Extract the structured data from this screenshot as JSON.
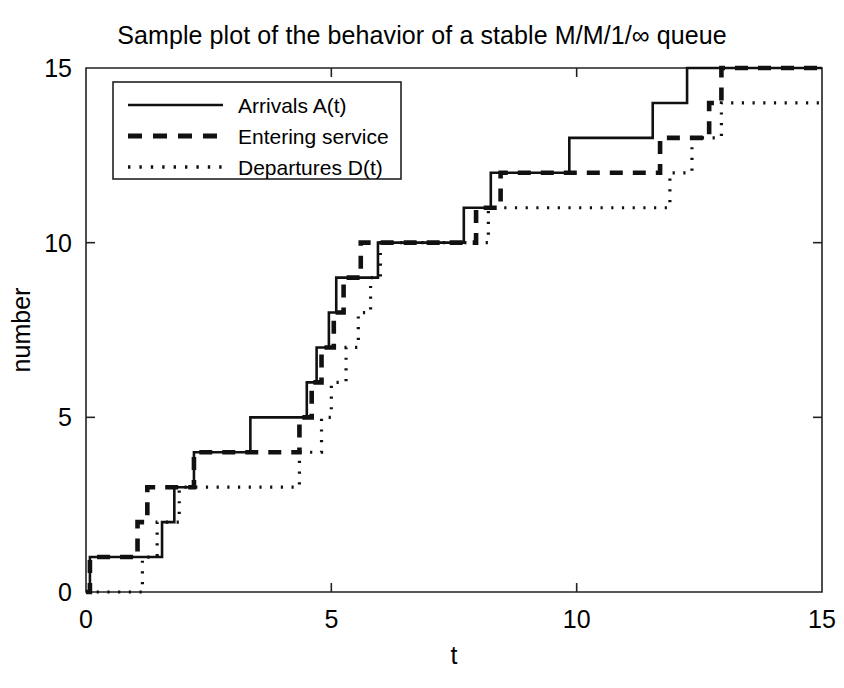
{
  "chart_data": {
    "type": "line",
    "title": "Sample plot of the behavior of a stable M/M/1/∞ queue",
    "xlabel": "t",
    "ylabel": "number",
    "xlim": [
      0,
      15
    ],
    "ylim": [
      0,
      15
    ],
    "xticks": [
      0,
      5,
      10,
      15
    ],
    "yticks": [
      0,
      5,
      10,
      15
    ],
    "xtick_labels": [
      "0",
      "5",
      "10",
      "15"
    ],
    "ytick_labels": [
      "0",
      "5",
      "10",
      "15"
    ],
    "grid": false,
    "legend_position": "upper-left",
    "step_type": "post",
    "series": [
      {
        "name": "Arrivals A(t)",
        "style": "solid",
        "points": [
          [
            0.0,
            0
          ],
          [
            0.08,
            0
          ],
          [
            0.08,
            1
          ],
          [
            1.55,
            1
          ],
          [
            1.55,
            2
          ],
          [
            1.8,
            2
          ],
          [
            1.8,
            3
          ],
          [
            2.2,
            3
          ],
          [
            2.2,
            4
          ],
          [
            3.35,
            4
          ],
          [
            3.35,
            5
          ],
          [
            4.5,
            5
          ],
          [
            4.5,
            6
          ],
          [
            4.7,
            6
          ],
          [
            4.7,
            7
          ],
          [
            4.95,
            7
          ],
          [
            4.95,
            8
          ],
          [
            5.1,
            8
          ],
          [
            5.1,
            9
          ],
          [
            5.95,
            9
          ],
          [
            5.95,
            10
          ],
          [
            7.7,
            10
          ],
          [
            7.7,
            11
          ],
          [
            8.25,
            11
          ],
          [
            8.25,
            12
          ],
          [
            9.85,
            12
          ],
          [
            9.85,
            13
          ],
          [
            11.55,
            13
          ],
          [
            11.55,
            14
          ],
          [
            12.25,
            14
          ],
          [
            12.25,
            15
          ],
          [
            15.0,
            15
          ]
        ]
      },
      {
        "name": "Entering service",
        "style": "dashed",
        "points": [
          [
            0.0,
            0
          ],
          [
            0.08,
            0
          ],
          [
            0.08,
            1
          ],
          [
            1.05,
            1
          ],
          [
            1.05,
            2
          ],
          [
            1.25,
            2
          ],
          [
            1.25,
            3
          ],
          [
            2.2,
            3
          ],
          [
            2.2,
            4
          ],
          [
            4.35,
            4
          ],
          [
            4.35,
            5
          ],
          [
            4.6,
            5
          ],
          [
            4.6,
            6
          ],
          [
            4.8,
            6
          ],
          [
            4.8,
            7
          ],
          [
            5.05,
            7
          ],
          [
            5.05,
            8
          ],
          [
            5.25,
            8
          ],
          [
            5.25,
            9
          ],
          [
            5.6,
            9
          ],
          [
            5.6,
            10
          ],
          [
            7.95,
            10
          ],
          [
            7.95,
            11
          ],
          [
            8.45,
            11
          ],
          [
            8.45,
            12
          ],
          [
            11.7,
            12
          ],
          [
            11.7,
            13
          ],
          [
            12.7,
            13
          ],
          [
            12.7,
            14
          ],
          [
            12.95,
            14
          ],
          [
            12.95,
            15
          ],
          [
            15.0,
            15
          ]
        ]
      },
      {
        "name": "Departures D(t)",
        "style": "dotted",
        "points": [
          [
            0.0,
            0
          ],
          [
            1.15,
            0
          ],
          [
            1.15,
            1
          ],
          [
            1.45,
            1
          ],
          [
            1.45,
            2
          ],
          [
            1.9,
            2
          ],
          [
            1.9,
            3
          ],
          [
            4.35,
            3
          ],
          [
            4.35,
            4
          ],
          [
            4.8,
            4
          ],
          [
            4.8,
            5
          ],
          [
            5.0,
            5
          ],
          [
            5.0,
            6
          ],
          [
            5.3,
            6
          ],
          [
            5.3,
            7
          ],
          [
            5.55,
            7
          ],
          [
            5.55,
            8
          ],
          [
            5.8,
            8
          ],
          [
            5.8,
            9
          ],
          [
            6.0,
            9
          ],
          [
            6.0,
            10
          ],
          [
            8.2,
            10
          ],
          [
            8.2,
            11
          ],
          [
            11.9,
            11
          ],
          [
            11.9,
            12
          ],
          [
            12.35,
            12
          ],
          [
            12.35,
            13
          ],
          [
            12.95,
            13
          ],
          [
            12.95,
            14
          ],
          [
            13.95,
            14
          ],
          [
            15.0,
            14
          ]
        ]
      }
    ]
  },
  "legend": {
    "entries": [
      {
        "label": "Arrivals A(t)",
        "style": "solid"
      },
      {
        "label": "Entering service",
        "style": "dashed"
      },
      {
        "label": "Departures D(t)",
        "style": "dotted"
      }
    ]
  }
}
